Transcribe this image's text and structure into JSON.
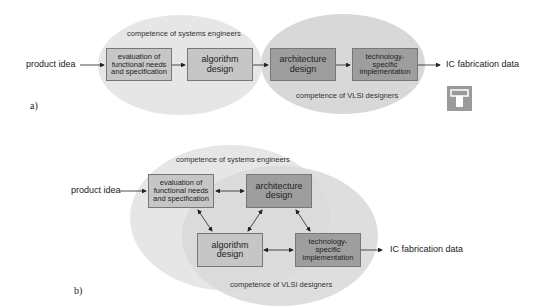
{
  "diagram_a": {
    "label": "a)",
    "input": "product idea",
    "output": "IC fabrication data",
    "region_systems": "competence of systems engineers",
    "region_vlsi": "competence of VLSI designers",
    "boxes": [
      {
        "id": "evaluation",
        "text": "evaluation of\nfunctional needs\nand specification",
        "shade": "light"
      },
      {
        "id": "algorithm",
        "text": "algorithm\ndesign",
        "shade": "light"
      },
      {
        "id": "architecture",
        "text": "architecture\ndesign",
        "shade": "dark"
      },
      {
        "id": "technology",
        "text": "technology-\nspecific\nimplementation",
        "shade": "dark"
      }
    ],
    "icon": "chip-pictogram-icon"
  },
  "diagram_b": {
    "label": "b)",
    "input": "product idea",
    "output": "IC fabrication data",
    "region_systems": "competence of systems engineers",
    "region_vlsi": "competence of VLSI designers",
    "boxes": [
      {
        "id": "evaluation",
        "text": "evaluation of\nfunctional needs\nand specification",
        "shade": "light"
      },
      {
        "id": "architecture",
        "text": "architecture\ndesign",
        "shade": "dark"
      },
      {
        "id": "algorithm",
        "text": "algorithm\ndesign",
        "shade": "light"
      },
      {
        "id": "technology",
        "text": "technology-\nspecific\nimplementation",
        "shade": "dark"
      }
    ]
  },
  "colors": {
    "ellipse_systems": "#e4e4e4",
    "ellipse_vlsi": "#d6d6d6",
    "box_light": "#c6c6c6",
    "box_dark": "#9e9e9e"
  }
}
